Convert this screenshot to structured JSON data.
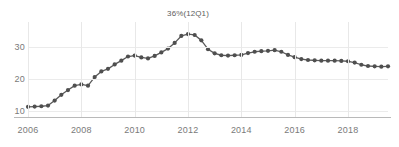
{
  "chart_data": {
    "type": "line",
    "title": "",
    "subtitle": "",
    "xlabel": "",
    "ylabel": "",
    "grid": "vertical-and-horizontal",
    "legend": "none",
    "xlim": [
      2006.0,
      2019.5
    ],
    "ylim": [
      8,
      38
    ],
    "x_tick_labels": [
      "2006",
      "2008",
      "2010",
      "2012",
      "2014",
      "2016",
      "2018"
    ],
    "x_tick_values": [
      2006,
      2008,
      2010,
      2012,
      2014,
      2016,
      2018
    ],
    "y_tick_labels": [
      "10",
      "20",
      "30"
    ],
    "y_tick_values": [
      10,
      20,
      30
    ],
    "annotations": [
      {
        "text": "36%(12Q1)",
        "x": 2012.0,
        "y": 36,
        "label_value": "36%",
        "label_period": "12Q1"
      }
    ],
    "series": [
      {
        "name": "series-1",
        "color": "#4f4f4f",
        "marker": "circle",
        "x": [
          2006.0,
          2006.25,
          2006.5,
          2006.75,
          2007.0,
          2007.25,
          2007.5,
          2007.75,
          2008.0,
          2008.25,
          2008.5,
          2008.75,
          2009.0,
          2009.25,
          2009.5,
          2009.75,
          2010.0,
          2010.25,
          2010.5,
          2010.75,
          2011.0,
          2011.25,
          2011.5,
          2011.75,
          2012.0,
          2012.25,
          2012.5,
          2012.75,
          2013.0,
          2013.25,
          2013.5,
          2013.75,
          2014.0,
          2014.25,
          2014.5,
          2014.75,
          2015.0,
          2015.25,
          2015.5,
          2015.75,
          2016.0,
          2016.25,
          2016.5,
          2016.75,
          2017.0,
          2017.25,
          2017.5,
          2017.75,
          2018.0,
          2018.25,
          2018.5,
          2018.75,
          2019.0,
          2019.25,
          2019.5
        ],
        "values": [
          11.2,
          11.3,
          11.4,
          11.6,
          13.2,
          15.0,
          16.5,
          17.9,
          18.3,
          17.9,
          20.6,
          22.4,
          23.2,
          24.6,
          25.8,
          27.1,
          27.4,
          26.8,
          26.5,
          27.3,
          28.4,
          29.6,
          31.4,
          33.6,
          34.2,
          33.9,
          32.2,
          29.4,
          28.1,
          27.5,
          27.4,
          27.5,
          27.6,
          28.2,
          28.6,
          28.8,
          28.9,
          29.1,
          28.6,
          27.6,
          26.9,
          26.3,
          26.0,
          25.9,
          25.8,
          25.8,
          25.8,
          25.7,
          25.6,
          25.2,
          24.5,
          24.1,
          24.0,
          23.9,
          24.0
        ]
      }
    ]
  }
}
